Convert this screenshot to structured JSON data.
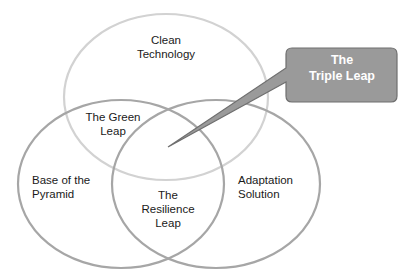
{
  "diagram": {
    "type": "venn",
    "circles": [
      {
        "id": "top",
        "label_line1": "Clean",
        "label_line2": "Technology",
        "stroke": "#cfcfcf"
      },
      {
        "id": "left",
        "label_line1": "Base of the",
        "label_line2": "Pyramid",
        "stroke": "#a8a8a8"
      },
      {
        "id": "right",
        "label_line1": "Adaptation",
        "label_line2": "Solution",
        "stroke": "#a8a8a8"
      }
    ],
    "intersections": {
      "green_leap": {
        "line1": "The Green",
        "line2": "Leap"
      },
      "resilience_leap": {
        "line1": "The",
        "line2": "Resilience",
        "line3": "Leap"
      }
    },
    "callout": {
      "line1": "The",
      "line2": "Triple Leap",
      "fill": "#9a9a9a",
      "text_color": "#ffffff"
    }
  }
}
